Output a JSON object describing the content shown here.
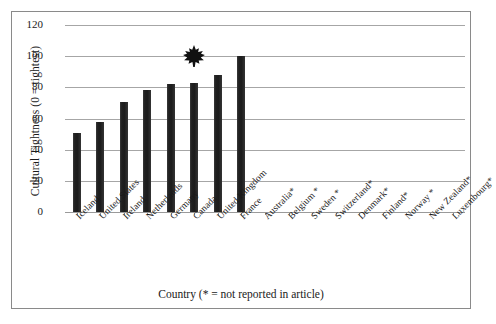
{
  "chart_data": {
    "type": "bar",
    "title": "",
    "xlabel": "Country (* = not reported in article)",
    "ylabel": "Cultural Tightness (0 = tightest)",
    "ylim": [
      0,
      120
    ],
    "ytick_values": [
      0,
      20,
      40,
      60,
      80,
      100,
      120
    ],
    "ytick_labels": [
      "0",
      "20",
      "40",
      "60",
      "80",
      "100",
      "120"
    ],
    "grid": true,
    "legend": "none",
    "categories": [
      "Iceland",
      "United States",
      "Ireland",
      "Netherlands",
      "Germany",
      "Canada",
      "United Kingdom",
      "France",
      "Australia*",
      "Belgium *",
      "Sweden *",
      "Switzerland*",
      "Denmark*",
      "Finland*",
      "Norway *",
      "New Zealand*",
      "Luxembourg*"
    ],
    "values": [
      51,
      57.5,
      70.5,
      78.5,
      82,
      83,
      88,
      100,
      null,
      null,
      null,
      null,
      null,
      null,
      null,
      null,
      null
    ],
    "bar_color": "#262626",
    "annotations": [
      {
        "name": "maple-leaf-marker",
        "icon": "maple-leaf-icon",
        "category": "Canada",
        "value": 100,
        "color": "#111111"
      }
    ]
  },
  "figure": {
    "frame_color": "#8a8a8a",
    "background": "#ffffff",
    "gridline_color": "#a6a6a6"
  }
}
